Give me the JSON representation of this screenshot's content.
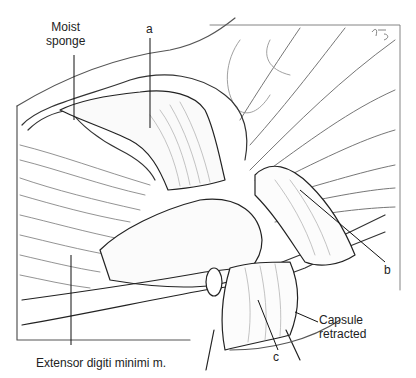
{
  "figure": {
    "signature": "KG",
    "colors": {
      "ink": "#222222",
      "shade": "#9a9a9a",
      "light": "#cfcfcf",
      "background": "#ffffff"
    }
  },
  "labels": {
    "moist_sponge": "Moist\nsponge",
    "a": "a",
    "b": "b",
    "c": "c",
    "capsule": "Capsule\nretracted",
    "extensor": "Extensor digiti minimi m."
  }
}
